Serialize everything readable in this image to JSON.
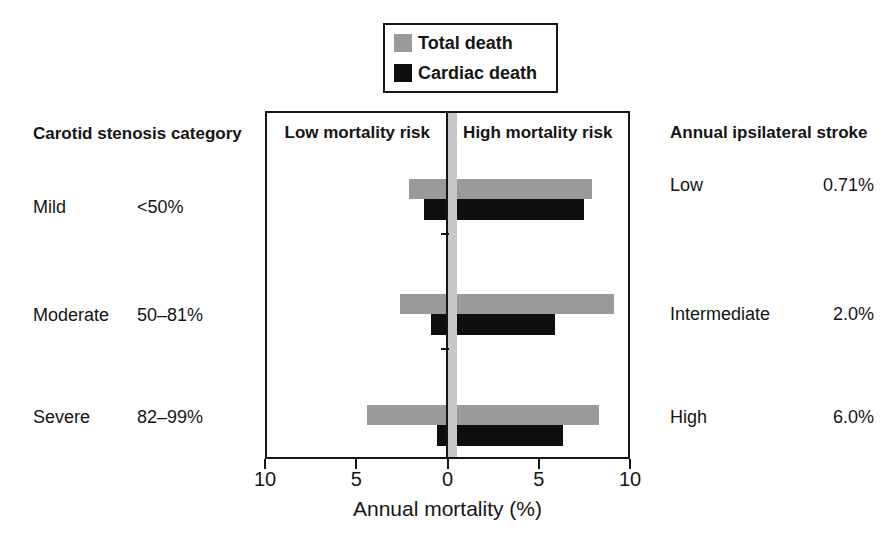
{
  "legend": {
    "items": [
      {
        "label": "Total death",
        "color": "#9a9a9a",
        "icon": "gray-square-swatch"
      },
      {
        "label": "Cardiac death",
        "color": "#0e0e0e",
        "icon": "black-square-swatch"
      }
    ]
  },
  "left_panel": {
    "header": "Carotid stenosis category",
    "rows": [
      {
        "label": "Mild",
        "range": "<50%"
      },
      {
        "label": "Moderate",
        "range": "50–81%"
      },
      {
        "label": "Severe",
        "range": "82–99%"
      }
    ]
  },
  "right_panel": {
    "header": "Annual ipsilateral stroke",
    "rows": [
      {
        "label": "Low",
        "value": "0.71%"
      },
      {
        "label": "Intermediate",
        "value": "2.0%"
      },
      {
        "label": "High",
        "value": "6.0%"
      }
    ]
  },
  "chart_data": {
    "type": "bar",
    "subtype": "horizontal-range-bars",
    "title": "",
    "xlabel": "Annual mortality (%)",
    "zone_labels": {
      "left": "Low mortality risk",
      "right": "High mortality risk"
    },
    "categories": [
      "Mild",
      "Moderate",
      "Severe"
    ],
    "series": [
      {
        "name": "Total death",
        "color": "#9a9a9a",
        "ranges": [
          [
            -2.2,
            7.8
          ],
          [
            -2.7,
            9.0
          ],
          [
            -4.5,
            8.2
          ]
        ]
      },
      {
        "name": "Cardiac death",
        "color": "#0e0e0e",
        "ranges": [
          [
            -1.4,
            7.4
          ],
          [
            -1.0,
            5.8
          ],
          [
            -0.7,
            6.2
          ]
        ]
      }
    ],
    "x_axis": {
      "range": [
        -10,
        10
      ],
      "ticks": [
        -10,
        -5,
        0,
        5,
        10
      ],
      "tick_labels": [
        "10",
        "5",
        "0",
        "5",
        "10"
      ]
    },
    "zero_band_color": "#c8c8c8",
    "legend_position": "top-center",
    "grid": false
  }
}
